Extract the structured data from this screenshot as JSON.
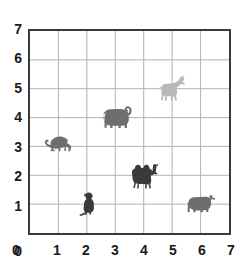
{
  "chart_data": {
    "type": "scatter",
    "title": "",
    "xlabel": "",
    "ylabel": "",
    "xlim": [
      0,
      7
    ],
    "ylim": [
      0,
      7
    ],
    "grid": true,
    "legend": "none",
    "x_ticks": [
      "0",
      "1",
      "2",
      "3",
      "4",
      "5",
      "6",
      "7"
    ],
    "y_ticks": [
      "0",
      "1",
      "2",
      "3",
      "4",
      "5",
      "6",
      "7"
    ],
    "x_tick_values": [
      0,
      1,
      2,
      3,
      4,
      5,
      6,
      7
    ],
    "y_tick_values": [
      0,
      1,
      2,
      3,
      4,
      5,
      6,
      7
    ],
    "point_style": "animal-silhouette",
    "points": [
      {
        "label": "monkey",
        "icon": "monkey-walking-icon",
        "x": 1,
        "y": 3,
        "color": "#6e6e6e"
      },
      {
        "label": "elephant",
        "icon": "elephant-icon",
        "x": 3,
        "y": 4,
        "color": "#6e6e6e"
      },
      {
        "label": "horse",
        "icon": "horse-icon",
        "x": 5,
        "y": 5,
        "color": "#b8b8b8"
      },
      {
        "label": "camel",
        "icon": "camel-icon",
        "x": 4,
        "y": 2,
        "color": "#3a3a3a"
      },
      {
        "label": "monkey",
        "icon": "monkey-sitting-icon",
        "x": 2,
        "y": 1,
        "color": "#3a3a3a"
      },
      {
        "label": "bear",
        "icon": "bear-icon",
        "x": 6,
        "y": 1,
        "color": "#6e6e6e"
      }
    ]
  },
  "colors": {
    "frame": "#3a3a3a",
    "grid": "#b0b0b0",
    "tick_text": "#1a1a1a",
    "background": "#ffffff",
    "light_gray": "#b8b8b8",
    "mid_gray": "#6e6e6e",
    "dark_gray": "#3a3a3a"
  }
}
